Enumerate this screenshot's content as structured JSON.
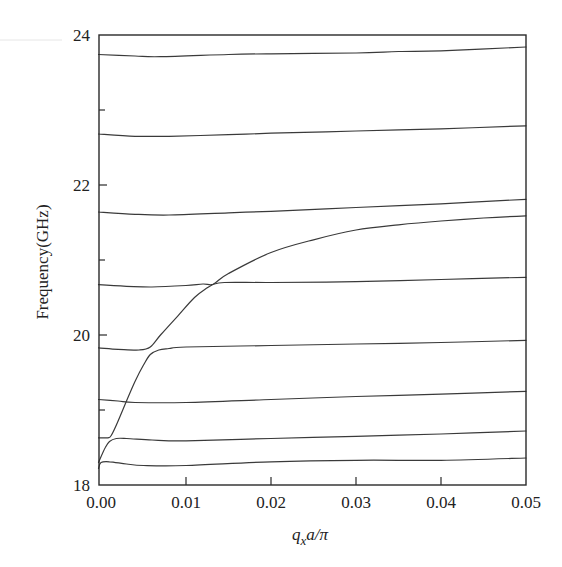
{
  "chart_data": {
    "type": "line",
    "title": "",
    "xlabel": "q_x a/π",
    "xlabel_parts": {
      "q": "q",
      "sub": "x",
      "rest": "a/π"
    },
    "ylabel": "Frequency(GHz)",
    "xlim": [
      -0.0003,
      0.05
    ],
    "ylim": [
      18,
      24
    ],
    "grid": false,
    "legend": null,
    "x_ticks": [
      {
        "value": 0.0,
        "label": "0.00"
      },
      {
        "value": 0.01,
        "label": "0.01"
      },
      {
        "value": 0.02,
        "label": "0.02"
      },
      {
        "value": 0.03,
        "label": "0.03"
      },
      {
        "value": 0.04,
        "label": "0.04"
      },
      {
        "value": 0.05,
        "label": "0.05"
      }
    ],
    "y_ticks": [
      {
        "value": 18,
        "label": "18"
      },
      {
        "value": 20,
        "label": "20"
      },
      {
        "value": 22,
        "label": "22"
      },
      {
        "value": 24,
        "label": "24"
      }
    ],
    "y_minor_ticks": [
      19,
      21,
      23
    ],
    "series": [
      {
        "name": "branch-1",
        "x": [
          -0.0003,
          0.0,
          0.001,
          0.003,
          0.005,
          0.01,
          0.02,
          0.03,
          0.04,
          0.05
        ],
        "y": [
          18.22,
          18.3,
          18.31,
          18.28,
          18.26,
          18.26,
          18.31,
          18.33,
          18.33,
          18.36
        ]
      },
      {
        "name": "branch-2",
        "x": [
          -0.0003,
          0.0005,
          0.001,
          0.0018,
          0.003,
          0.006,
          0.01,
          0.02,
          0.03,
          0.04,
          0.05
        ],
        "y": [
          18.3,
          18.5,
          18.58,
          18.62,
          18.62,
          18.6,
          18.59,
          18.62,
          18.65,
          18.68,
          18.72
        ]
      },
      {
        "name": "branch-3",
        "x": [
          -0.0003,
          0.0008,
          0.0012,
          0.002,
          0.003,
          0.004,
          0.005,
          0.0058,
          0.0068,
          0.008,
          0.01,
          0.02,
          0.03,
          0.04,
          0.05
        ],
        "y": [
          18.63,
          18.63,
          18.66,
          18.85,
          19.12,
          19.38,
          19.6,
          19.74,
          19.8,
          19.82,
          19.84,
          19.86,
          19.88,
          19.9,
          19.93
        ]
      },
      {
        "name": "branch-4",
        "x": [
          -0.0003,
          0.002,
          0.004,
          0.01,
          0.02,
          0.03,
          0.04,
          0.05
        ],
        "y": [
          19.14,
          19.12,
          19.1,
          19.1,
          19.14,
          19.18,
          19.21,
          19.25
        ]
      },
      {
        "name": "branch-5",
        "x": [
          -0.0003,
          0.002,
          0.0045,
          0.0058,
          0.007,
          0.009,
          0.011,
          0.0125,
          0.0135,
          0.015,
          0.02,
          0.025,
          0.03,
          0.035,
          0.04,
          0.045,
          0.05
        ],
        "y": [
          19.83,
          19.81,
          19.8,
          19.84,
          20.0,
          20.25,
          20.5,
          20.63,
          20.7,
          20.82,
          21.1,
          21.27,
          21.4,
          21.47,
          21.52,
          21.56,
          21.59
        ]
      },
      {
        "name": "branch-6",
        "x": [
          -0.0003,
          0.003,
          0.006,
          0.01,
          0.012,
          0.013,
          0.0145,
          0.02,
          0.03,
          0.04,
          0.05
        ],
        "y": [
          20.67,
          20.65,
          20.64,
          20.66,
          20.68,
          20.67,
          20.7,
          20.7,
          20.71,
          20.74,
          20.77
        ]
      },
      {
        "name": "branch-7",
        "x": [
          -0.0003,
          0.004,
          0.008,
          0.015,
          0.02,
          0.03,
          0.04,
          0.05
        ],
        "y": [
          21.64,
          21.61,
          21.6,
          21.63,
          21.65,
          21.7,
          21.75,
          21.81
        ]
      },
      {
        "name": "branch-8",
        "x": [
          -0.0003,
          0.004,
          0.008,
          0.015,
          0.02,
          0.03,
          0.04,
          0.05
        ],
        "y": [
          22.68,
          22.65,
          22.65,
          22.67,
          22.69,
          22.72,
          22.75,
          22.79
        ]
      },
      {
        "name": "branch-9",
        "x": [
          -0.0003,
          0.004,
          0.007,
          0.015,
          0.02,
          0.03,
          0.035,
          0.04,
          0.05
        ],
        "y": [
          23.74,
          23.72,
          23.71,
          23.74,
          23.75,
          23.76,
          23.78,
          23.79,
          23.84
        ]
      }
    ]
  }
}
